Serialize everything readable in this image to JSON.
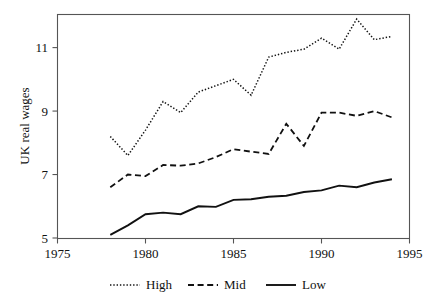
{
  "chart_data": {
    "type": "line",
    "title": "",
    "subtitle": "",
    "xlabel": "",
    "ylabel": "UK real wages",
    "xlim": [
      1975,
      1995
    ],
    "ylim": [
      5,
      11.95
    ],
    "grid": false,
    "legend_position": "bottom",
    "x_ticks": [
      1975,
      1980,
      1985,
      1990,
      1995
    ],
    "x_tick_labels": [
      "1975",
      "1980",
      "1985",
      "1990",
      "1995"
    ],
    "y_ticks": [
      5,
      7,
      9,
      11
    ],
    "y_tick_labels": [
      "5",
      "7",
      "9",
      "11"
    ],
    "x": [
      1978,
      1979,
      1980,
      1981,
      1982,
      1983,
      1984,
      1985,
      1986,
      1987,
      1988,
      1989,
      1990,
      1991,
      1992,
      1993,
      1994
    ],
    "series": [
      {
        "name": "High",
        "style": "dotted",
        "values": [
          8.2,
          7.6,
          8.4,
          9.3,
          8.95,
          9.6,
          9.8,
          10.0,
          9.5,
          10.7,
          10.85,
          10.95,
          11.3,
          10.95,
          11.9,
          11.25,
          11.35
        ]
      },
      {
        "name": "Mid",
        "style": "dashed",
        "values": [
          6.6,
          7.0,
          6.95,
          7.3,
          7.28,
          7.35,
          7.55,
          7.8,
          7.72,
          7.65,
          8.6,
          7.9,
          8.95,
          8.95,
          8.85,
          9.0,
          8.8
        ]
      },
      {
        "name": "Low",
        "style": "solid",
        "values": [
          5.1,
          5.4,
          5.75,
          5.8,
          5.75,
          6.0,
          5.98,
          6.2,
          6.22,
          6.3,
          6.33,
          6.45,
          6.5,
          6.65,
          6.6,
          6.75,
          6.85
        ]
      }
    ]
  },
  "axes": {
    "y_axis_label": "UK real wages"
  },
  "legend": {
    "items": [
      {
        "label": "High",
        "style": "dotted"
      },
      {
        "label": "Mid",
        "style": "dashed"
      },
      {
        "label": "Low",
        "style": "solid"
      }
    ]
  },
  "colors": {
    "line": "#111111",
    "frame": "#555555",
    "background": "#ffffff"
  }
}
